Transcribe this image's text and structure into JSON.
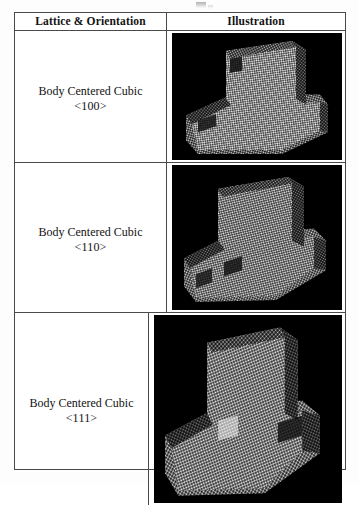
{
  "document": {
    "type": "scanned-table-figure",
    "page_background": "#fdfdfd",
    "border_color": "#4a4a4a",
    "panel_background": "#000000",
    "atom_color": "#e8e8e8"
  },
  "table": {
    "header": {
      "col_lattice": "Lattice & Orientation",
      "col_illustration": "Illustration"
    },
    "rows": [
      {
        "lattice": "Body Centered Cubic",
        "orientation": "<100>",
        "illustration": {
          "name": "bcc-100-atomistic-render",
          "description": "Grayscale 3D atomistic rendering of a T-shaped (mushroom) body centered cubic crystal block on a black background"
        }
      },
      {
        "lattice": "Body Centered Cubic",
        "orientation": "<110>",
        "illustration": {
          "name": "bcc-110-atomistic-render",
          "description": "Grayscale 3D atomistic rendering of a T-shaped (mushroom) body centered cubic crystal block on a black background"
        }
      },
      {
        "lattice": "Body Centered Cubic",
        "orientation": "<111>",
        "illustration": {
          "name": "bcc-111-atomistic-render",
          "description": "Grayscale 3D atomistic rendering of a T-shaped (mushroom) body centered cubic crystal block on a black background"
        }
      }
    ]
  }
}
